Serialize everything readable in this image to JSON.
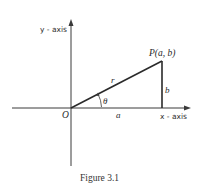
{
  "figure": {
    "caption": "Figure 3.1",
    "origin_label": "O",
    "point_label": "P(a, b)",
    "x_axis_label": "x - axis",
    "y_axis_label": "y - axis",
    "hypotenuse_label": "r",
    "adjacent_label": "a",
    "opposite_label": "b",
    "angle_label": "θ"
  },
  "colors": {
    "line": "#2a2a2a",
    "axis": "#3a3a3a",
    "background": "#ffffff"
  }
}
